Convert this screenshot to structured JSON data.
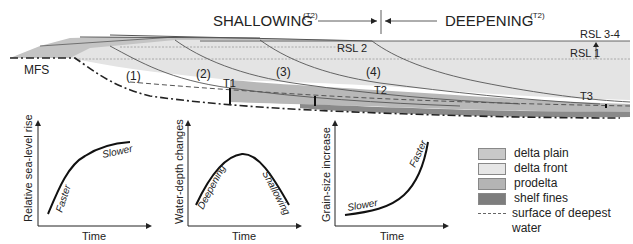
{
  "header": {
    "shallowing": "SHALLOWING",
    "shallowing_sup": "(T2)",
    "deepening": "DEEPENING",
    "deepening_sup": "(T2)"
  },
  "cross_section": {
    "mfs_label": "MFS",
    "rsl_labels": [
      "RSL 3-4",
      "RSL 2",
      "RSL 1"
    ],
    "clinoform_labels": [
      "(1)",
      "(2)",
      "(3)",
      "(4)"
    ],
    "time_markers": [
      "T1",
      "T2",
      "T3"
    ]
  },
  "graphs": [
    {
      "ylabel": "Relative sea-level rise",
      "xlabel": "Time",
      "annotations": [
        "Faster",
        "Slower"
      ]
    },
    {
      "ylabel": "Water-depth changes",
      "xlabel": "Time",
      "annotations": [
        "Deepening",
        "Shallowing"
      ]
    },
    {
      "ylabel": "Grain-size increase",
      "xlabel": "Time",
      "annotations": [
        "Slower",
        "Faster"
      ]
    }
  ],
  "legend": {
    "items": [
      {
        "label": "delta plain",
        "color": "#c8c8c8"
      },
      {
        "label": "delta front",
        "color": "#e6e6e6"
      },
      {
        "label": "prodelta",
        "color": "#b4b4b4"
      },
      {
        "label": "shelf fines",
        "color": "#7d7d7d"
      }
    ],
    "dashed_label_1": "surface of deepest",
    "dashed_label_2": "water"
  }
}
